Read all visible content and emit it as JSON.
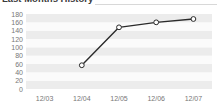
{
  "widget": {
    "title": "Last Months History"
  },
  "chart_data": {
    "type": "line",
    "title": "Last Months History",
    "xlabel": "",
    "ylabel": "",
    "categories": [
      "12/03",
      "12/04",
      "12/05",
      "12/06",
      "12/07"
    ],
    "series": [
      {
        "name": "History",
        "values": [
          null,
          57,
          148,
          160,
          168
        ]
      }
    ],
    "ylim": [
      0,
      180
    ],
    "yticks": [
      0,
      20,
      40,
      60,
      80,
      100,
      120,
      140,
      160,
      180
    ],
    "xticks": [
      "12/03",
      "12/04",
      "12/05",
      "12/06",
      "12/07"
    ],
    "grid": true,
    "grid_style": "alternating-horizontal-bands",
    "legend": "none",
    "marker": "open-circle",
    "colors": {
      "line": "#2b2b2b",
      "marker_fill": "#ffffff",
      "marker_stroke": "#2b2b2b",
      "band_light": "#fbfbfb",
      "band_dark": "#ececec",
      "tick_text": "#777777",
      "title_text": "#3a3a3a"
    }
  }
}
